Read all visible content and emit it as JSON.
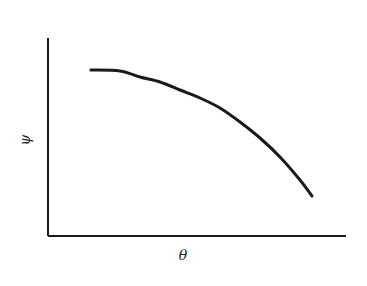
{
  "chart_data": {
    "type": "line",
    "title": "",
    "xlabel": "θ",
    "ylabel": "ψ",
    "grid": false,
    "legend": null,
    "x_ticks": [],
    "y_ticks": [],
    "series": [
      {
        "name": "ψ(θ)",
        "description": "monotonically decreasing concave curve",
        "points_px": [
          [
            91,
            70
          ],
          [
            120,
            71
          ],
          [
            140,
            77
          ],
          [
            160,
            82
          ],
          [
            180,
            90
          ],
          [
            200,
            98
          ],
          [
            220,
            108
          ],
          [
            240,
            122
          ],
          [
            260,
            138
          ],
          [
            280,
            157
          ],
          [
            300,
            180
          ],
          [
            312,
            196
          ]
        ]
      }
    ],
    "axes_px": {
      "origin": [
        48,
        236
      ],
      "y_top": 38,
      "x_right": 346
    },
    "colors": {
      "line": "#1a1a1a",
      "axis": "#1a1a1a",
      "background": "#ffffff"
    }
  }
}
